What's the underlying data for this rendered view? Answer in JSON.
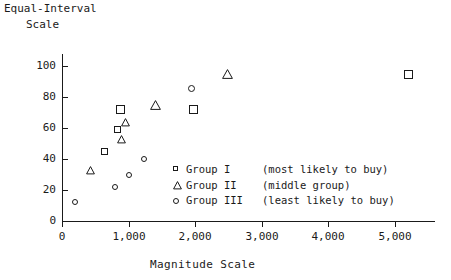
{
  "chart_data": {
    "type": "scatter",
    "title": "",
    "ylabel_lines": [
      "Equal-Interval",
      "Scale"
    ],
    "ylabel": "Equal-Interval Scale",
    "xlabel": "Magnitude Scale",
    "xlim": [
      0,
      5600
    ],
    "ylim": [
      0,
      108
    ],
    "grid": false,
    "xticks": [
      0,
      1000,
      2000,
      3000,
      4000,
      5000
    ],
    "xtick_labels": [
      "0",
      "1,000",
      "2,000",
      "3,000",
      "4,000",
      "5,000"
    ],
    "yticks": [
      0,
      20,
      40,
      60,
      80,
      100
    ],
    "ytick_labels": [
      "0",
      "20",
      "40",
      "60",
      "80",
      "100"
    ],
    "legend_position": "inside-lower-right",
    "series": [
      {
        "name": "Group I",
        "marker": "square",
        "legend_label": "Group I",
        "legend_desc": "(most likely to buy)",
        "points": [
          {
            "x": 640,
            "y": 45
          },
          {
            "x": 830,
            "y": 59
          },
          {
            "x": 880,
            "y": 72
          },
          {
            "x": 1980,
            "y": 72
          },
          {
            "x": 5200,
            "y": 95
          }
        ]
      },
      {
        "name": "Group II",
        "marker": "triangle",
        "legend_label": "Group II",
        "legend_desc": "(middle group)",
        "points": [
          {
            "x": 430,
            "y": 33
          },
          {
            "x": 900,
            "y": 53
          },
          {
            "x": 960,
            "y": 64
          },
          {
            "x": 1400,
            "y": 75
          },
          {
            "x": 2480,
            "y": 95
          }
        ]
      },
      {
        "name": "Group III",
        "marker": "circle",
        "legend_label": "Group III",
        "legend_desc": "(least likely to buy)",
        "points": [
          {
            "x": 200,
            "y": 12
          },
          {
            "x": 790,
            "y": 22
          },
          {
            "x": 1010,
            "y": 30
          },
          {
            "x": 1230,
            "y": 40
          },
          {
            "x": 1950,
            "y": 86
          }
        ]
      }
    ]
  },
  "axes": {
    "y_title_line1": "Equal-Interval",
    "y_title_line2": "Scale",
    "x_title": "Magnitude Scale"
  },
  "legend": {
    "rows": [
      {
        "marker": "square",
        "name": "Group I",
        "desc": "(most likely to buy)"
      },
      {
        "marker": "triangle",
        "name": "Group II",
        "desc": "(middle group)"
      },
      {
        "marker": "circle",
        "name": "Group III",
        "desc": "(least likely to buy)"
      }
    ]
  },
  "colors": {
    "ink": "#1a1a1a",
    "background": "#ffffff"
  }
}
